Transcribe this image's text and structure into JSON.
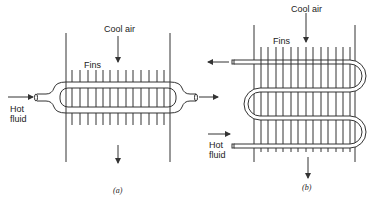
{
  "diagram_a": {
    "cool_air_label": "Cool air",
    "fins_label": "Fins",
    "hot_fluid_label_line1": "Hot",
    "hot_fluid_label_line2": "fluid",
    "caption": "(a)"
  },
  "diagram_b": {
    "cool_air_label": "Cool air",
    "fins_label": "Fins",
    "hot_fluid_label_line1": "Hot",
    "hot_fluid_label_line2": "fluid",
    "caption": "(b)"
  },
  "colors": {
    "line": "#333333",
    "background": "#ffffff"
  }
}
